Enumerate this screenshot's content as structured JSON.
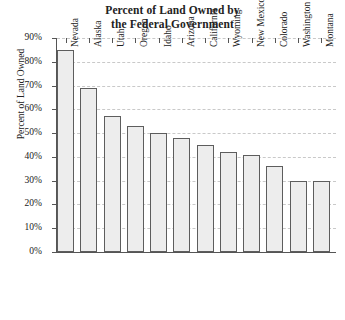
{
  "chart_data": {
    "type": "bar",
    "title": "Percent of Land Owned by the Federal Government",
    "title_line1": "Percent of Land Owned by",
    "title_line2": "the Federal Government",
    "xlabel": "",
    "ylabel": "Percent of Land Owned",
    "ylim": [
      0,
      90
    ],
    "ytick_step": 10,
    "ytick_labels": [
      "0%",
      "10%",
      "20%",
      "30%",
      "40%",
      "50%",
      "60%",
      "70%",
      "80%",
      "90%"
    ],
    "ytick_values": [
      0,
      10,
      20,
      30,
      40,
      50,
      60,
      70,
      80,
      90
    ],
    "grid": true,
    "grid_axis": "y",
    "legend": false,
    "categories": [
      "Nevada",
      "Alaska",
      "Utah",
      "Oregon",
      "Idaho",
      "Arizona",
      "California",
      "Wyoming",
      "New Mexico",
      "Colorado",
      "Washington",
      "Montana"
    ],
    "values": [
      85,
      69,
      57,
      53,
      50,
      48,
      45,
      42,
      41,
      36,
      30,
      30
    ],
    "bar_fill_color": "#ededed",
    "bar_edge_color": "#5d5d5d",
    "axis_color": "#555555",
    "grid_color": "#c9c9c9",
    "background_color": "#ffffff"
  }
}
